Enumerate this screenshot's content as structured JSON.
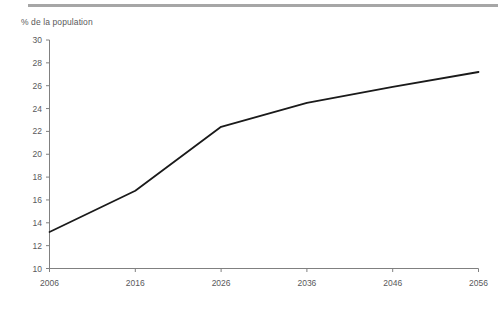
{
  "chart_data": {
    "type": "line",
    "title": "",
    "subtitle": "",
    "ylabel": "% de la population",
    "xlabel": "",
    "x": [
      2006,
      2016,
      2026,
      2036,
      2046,
      2056
    ],
    "categories": [
      "2006",
      "2016",
      "2026",
      "2036",
      "2046",
      "2056"
    ],
    "series": [
      {
        "name": "% de la population",
        "values": [
          13.2,
          16.8,
          22.4,
          24.5,
          25.9,
          27.2
        ],
        "color": "#1a1a1a"
      }
    ],
    "xlim": [
      2006,
      2056
    ],
    "ylim": [
      10,
      30
    ],
    "ytick_values": [
      10,
      12,
      14,
      16,
      18,
      20,
      22,
      24,
      26,
      28,
      30
    ],
    "ytick_labels": [
      "10",
      "12",
      "14",
      "16",
      "18",
      "20",
      "22",
      "24",
      "26",
      "28",
      "30"
    ],
    "xtick_values": [
      2006,
      2016,
      2026,
      2036,
      2046,
      2056
    ],
    "xtick_labels": [
      "2006",
      "2016",
      "2026",
      "2036",
      "2046",
      "2056"
    ],
    "grid": false,
    "legend": false,
    "legend_position": "none"
  },
  "style": {
    "axis_color": "#808080",
    "text_color": "#59595b",
    "line_color": "#1a1a1a",
    "rule_color": "#a6a6a6",
    "background": "#ffffff"
  }
}
